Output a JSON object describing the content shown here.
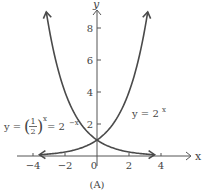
{
  "chart_data": {
    "type": "line",
    "title": "",
    "caption": "(A)",
    "xlabel": "x",
    "ylabel": "y",
    "xlim": [
      -4.5,
      4.8
    ],
    "ylim": [
      0,
      9
    ],
    "x_ticks": [
      -4,
      -2,
      0,
      2,
      4
    ],
    "x_tick_labels": [
      "-4",
      "-2",
      "0",
      "2",
      "4"
    ],
    "y_ticks": [
      2,
      4,
      6,
      8
    ],
    "y_tick_labels": [
      "2",
      "4",
      "6",
      "8"
    ],
    "grid": false,
    "series": [
      {
        "name": "y = 2^x",
        "label_text": "y = 2",
        "label_exp": "x",
        "x": [
          -3.5,
          -3,
          -2,
          -1,
          0,
          1,
          2,
          3,
          3.2
        ],
        "values": [
          0.09,
          0.125,
          0.25,
          0.5,
          1,
          2,
          4,
          8,
          9.19
        ]
      },
      {
        "name": "y = (1/2)^x = 2^-x",
        "label_text": "y = (1/2)",
        "label_exp": "x",
        "label_rhs": "= 2",
        "label_rhs_exp": "-x",
        "x": [
          -3.2,
          -3,
          -2,
          -1,
          0,
          1,
          2,
          3,
          3.5
        ],
        "values": [
          9.19,
          8,
          4,
          2,
          1,
          0.5,
          0.25,
          0.125,
          0.09
        ]
      }
    ]
  }
}
